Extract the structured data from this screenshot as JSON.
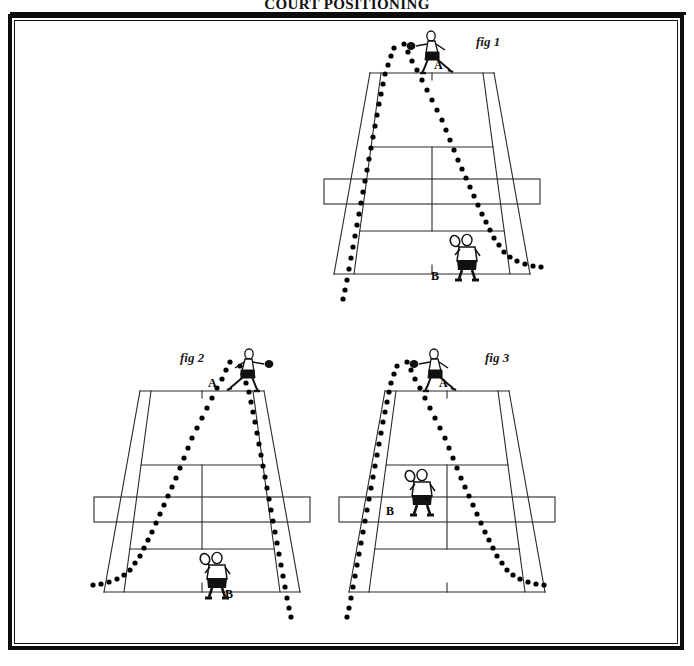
{
  "page": {
    "title": "COURT POSITIONING"
  },
  "figures": [
    {
      "id": "fig-1",
      "label": "fig 1",
      "label_pos": {
        "x": 134,
        "y": 8
      },
      "court": {
        "far_baseline": {
          "left_x": 28,
          "right_x": 152,
          "y": 47
        },
        "near_baseline": {
          "left_x": -8,
          "right_x": 188,
          "y": 248
        },
        "far_service_line_y": 121,
        "near_service_line_y": 205,
        "net_y": 167,
        "net_rect": {
          "x": -18,
          "y": 153,
          "w": 216,
          "h": 25
        },
        "alley_offset_far": 11,
        "alley_offset_near": 20
      },
      "players": [
        {
          "name": "A",
          "role": "striker-far-court",
          "pose": "lunge-forehand-right",
          "facing": "right",
          "x": 56,
          "y": 2,
          "label_x": 92,
          "label_y": 32,
          "label": "A"
        },
        {
          "name": "B",
          "role": "receiver-baseline",
          "pose": "ready-back-view",
          "facing": "away",
          "x": 100,
          "y": 205,
          "label_x": 89,
          "label_y": 243,
          "label": "B"
        }
      ],
      "trajectories": [
        {
          "name": "down-the-line-ball",
          "start": {
            "x": 52,
            "y": 22
          },
          "points": [
            [
              52,
              22
            ],
            [
              49,
              30
            ],
            [
              46,
              39
            ],
            [
              43,
              48
            ],
            [
              41,
              58
            ],
            [
              39,
              68
            ],
            [
              37,
              78
            ],
            [
              35,
              89
            ],
            [
              33,
              100
            ],
            [
              31,
              111
            ],
            [
              29,
              122
            ],
            [
              27,
              133
            ],
            [
              25,
              144
            ],
            [
              23,
              155
            ],
            [
              21,
              166
            ],
            [
              19,
              177
            ],
            [
              17,
              188
            ],
            [
              15,
              199
            ],
            [
              13,
              210
            ],
            [
              11,
              221
            ],
            [
              9,
              232
            ],
            [
              7,
              243
            ],
            [
              5,
              254
            ],
            [
              3,
              264
            ],
            [
              1,
              273
            ]
          ]
        },
        {
          "name": "cross-court-ball",
          "start": {
            "x": 62,
            "y": 18
          },
          "points": [
            [
              62,
              18
            ],
            [
              66,
              26
            ],
            [
              70,
              35
            ],
            [
              75,
              44
            ],
            [
              80,
              54
            ],
            [
              85,
              64
            ],
            [
              90,
              74
            ],
            [
              95,
              84
            ],
            [
              100,
              94
            ],
            [
              104,
              104
            ],
            [
              108,
              114
            ],
            [
              112,
              124
            ],
            [
              116,
              134
            ],
            [
              120,
              143
            ],
            [
              124,
              152
            ],
            [
              128,
              161
            ],
            [
              132,
              170
            ],
            [
              136,
              179
            ],
            [
              140,
              188
            ],
            [
              144,
              196
            ],
            [
              148,
              204
            ],
            [
              152,
              212
            ],
            [
              157,
              219
            ],
            [
              162,
              226
            ],
            [
              168,
              231
            ],
            [
              175,
              235
            ],
            [
              183,
              238
            ],
            [
              191,
              240
            ],
            [
              199,
              241
            ]
          ]
        }
      ]
    },
    {
      "id": "fig-2",
      "label": "fig 2",
      "label_pos": {
        "x": 68,
        "y": 6
      },
      "court": {
        "far_baseline": {
          "left_x": 28,
          "right_x": 152,
          "y": 47
        },
        "near_baseline": {
          "left_x": -8,
          "right_x": 188,
          "y": 248
        },
        "far_service_line_y": 121,
        "near_service_line_y": 205,
        "net_y": 167,
        "net_rect": {
          "x": -18,
          "y": 153,
          "w": 216,
          "h": 25
        },
        "alley_offset_far": 11,
        "alley_offset_near": 20
      },
      "players": [
        {
          "name": "A",
          "role": "striker-far-court",
          "pose": "lunge-forehand-left",
          "facing": "left",
          "x": 108,
          "y": 2,
          "label_x": 96,
          "label_y": 32,
          "label": "A"
        },
        {
          "name": "B",
          "role": "receiver-baseline",
          "pose": "ready-back-view",
          "facing": "away",
          "x": 80,
          "y": 205,
          "label_x": 113,
          "label_y": 243,
          "label": "B"
        }
      ],
      "trajectories": [
        {
          "name": "down-the-line-ball",
          "start": {
            "x": 128,
            "y": 22
          },
          "points": [
            [
              128,
              22
            ],
            [
              131,
              30
            ],
            [
              134,
              39
            ],
            [
              137,
              48
            ],
            [
              139,
              58
            ],
            [
              141,
              68
            ],
            [
              143,
              78
            ],
            [
              145,
              89
            ],
            [
              147,
              100
            ],
            [
              149,
              111
            ],
            [
              151,
              122
            ],
            [
              153,
              133
            ],
            [
              155,
              144
            ],
            [
              157,
              155
            ],
            [
              159,
              166
            ],
            [
              161,
              177
            ],
            [
              163,
              188
            ],
            [
              165,
              199
            ],
            [
              167,
              210
            ],
            [
              169,
              221
            ],
            [
              171,
              232
            ],
            [
              173,
              243
            ],
            [
              175,
              254
            ],
            [
              177,
              264
            ],
            [
              179,
              273
            ]
          ]
        },
        {
          "name": "cross-court-ball",
          "start": {
            "x": 118,
            "y": 18
          },
          "points": [
            [
              118,
              18
            ],
            [
              114,
              26
            ],
            [
              110,
              35
            ],
            [
              105,
              44
            ],
            [
              100,
              54
            ],
            [
              95,
              64
            ],
            [
              90,
              74
            ],
            [
              85,
              84
            ],
            [
              80,
              94
            ],
            [
              76,
              104
            ],
            [
              72,
              114
            ],
            [
              68,
              124
            ],
            [
              64,
              134
            ],
            [
              60,
              143
            ],
            [
              56,
              152
            ],
            [
              52,
              161
            ],
            [
              48,
              170
            ],
            [
              44,
              179
            ],
            [
              40,
              188
            ],
            [
              36,
              196
            ],
            [
              32,
              204
            ],
            [
              28,
              212
            ],
            [
              23,
              219
            ],
            [
              18,
              226
            ],
            [
              12,
              231
            ],
            [
              5,
              235
            ],
            [
              -3,
              238
            ],
            [
              -11,
              240
            ],
            [
              -19,
              241
            ]
          ]
        }
      ]
    },
    {
      "id": "fig-3",
      "label": "fig 3",
      "label_pos": {
        "x": 128,
        "y": 6
      },
      "court": {
        "far_baseline": {
          "left_x": 28,
          "right_x": 152,
          "y": 47
        },
        "near_baseline": {
          "left_x": -8,
          "right_x": 188,
          "y": 248
        },
        "far_service_line_y": 121,
        "near_service_line_y": 205,
        "net_y": 167,
        "net_rect": {
          "x": -18,
          "y": 153,
          "w": 216,
          "h": 25
        },
        "alley_offset_far": 11,
        "alley_offset_near": 20
      },
      "players": [
        {
          "name": "A",
          "role": "striker-far-court",
          "pose": "lunge-forehand-right",
          "facing": "right",
          "x": 44,
          "y": 2,
          "label_x": 82,
          "label_y": 32,
          "label": "A"
        },
        {
          "name": "B",
          "role": "receiver-midcourt",
          "pose": "ready-back-view",
          "facing": "away",
          "x": 40,
          "y": 122,
          "label_x": 29,
          "label_y": 160,
          "label": "B"
        }
      ],
      "trajectories": [
        {
          "name": "down-the-line-ball",
          "start": {
            "x": 40,
            "y": 22
          },
          "points": [
            [
              40,
              22
            ],
            [
              37,
              30
            ],
            [
              34,
              39
            ],
            [
              32,
              48
            ],
            [
              30,
              58
            ],
            [
              28,
              68
            ],
            [
              26,
              78
            ],
            [
              24,
              89
            ],
            [
              22,
              100
            ],
            [
              20,
              111
            ],
            [
              18,
              122
            ],
            [
              16,
              133
            ],
            [
              14,
              144
            ],
            [
              12,
              155
            ],
            [
              10,
              166
            ],
            [
              8,
              177
            ],
            [
              6,
              188
            ],
            [
              4,
              199
            ],
            [
              2,
              210
            ],
            [
              0,
              221
            ],
            [
              -2,
              232
            ],
            [
              -4,
              243
            ],
            [
              -6,
              254
            ],
            [
              -8,
              264
            ],
            [
              -10,
              273
            ]
          ]
        },
        {
          "name": "cross-court-ball",
          "start": {
            "x": 50,
            "y": 18
          },
          "points": [
            [
              50,
              18
            ],
            [
              54,
              26
            ],
            [
              58,
              35
            ],
            [
              63,
              44
            ],
            [
              68,
              54
            ],
            [
              73,
              64
            ],
            [
              78,
              74
            ],
            [
              83,
              84
            ],
            [
              88,
              94
            ],
            [
              92,
              104
            ],
            [
              96,
              114
            ],
            [
              100,
              124
            ],
            [
              104,
              134
            ],
            [
              108,
              143
            ],
            [
              112,
              152
            ],
            [
              116,
              161
            ],
            [
              120,
              170
            ],
            [
              124,
              179
            ],
            [
              128,
              188
            ],
            [
              132,
              196
            ],
            [
              136,
              204
            ],
            [
              140,
              212
            ],
            [
              145,
              219
            ],
            [
              150,
              226
            ],
            [
              156,
              231
            ],
            [
              163,
              235
            ],
            [
              171,
              238
            ],
            [
              179,
              240
            ],
            [
              187,
              241
            ]
          ]
        }
      ]
    }
  ],
  "colors": {
    "ink": "#111111",
    "court_line": "#2a2a2a",
    "ball_dot": "#000000",
    "frame": "#0d0d0d"
  }
}
